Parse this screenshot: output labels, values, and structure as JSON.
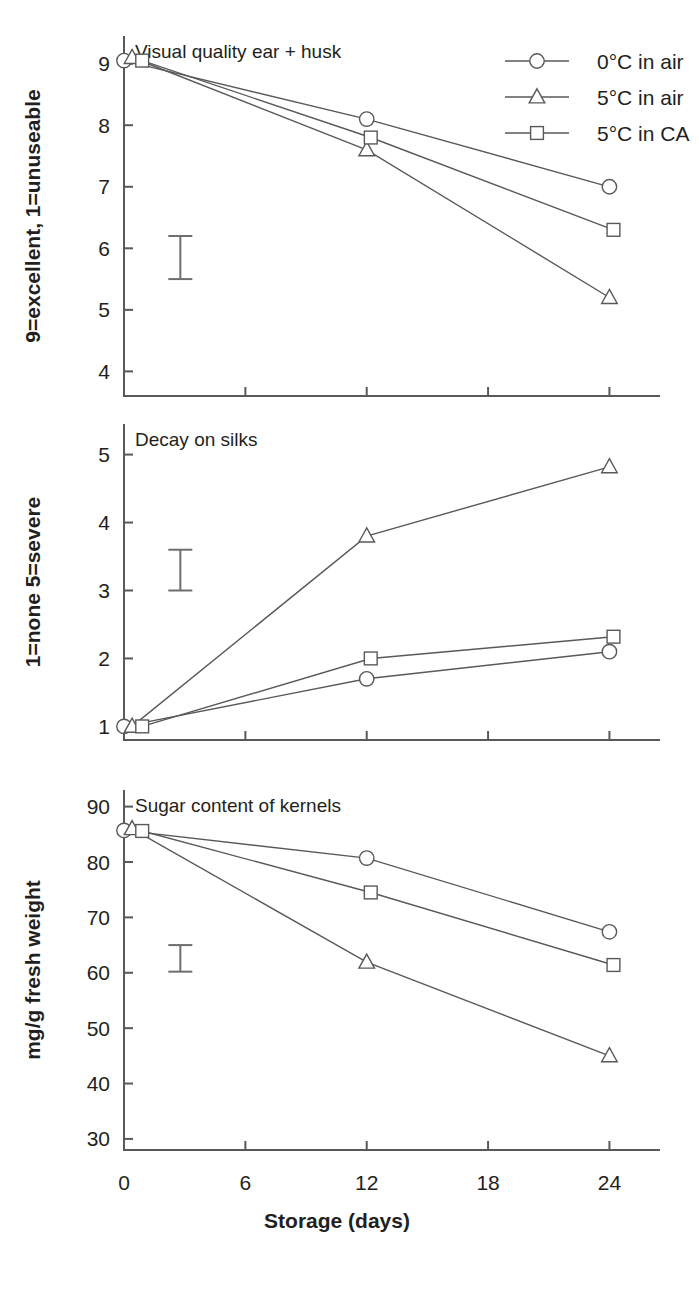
{
  "page": {
    "background": "#ffffff",
    "ink_color": "#231f20",
    "line_color": "#58595b",
    "cropped_header_text": ""
  },
  "legend": {
    "position": "top-right",
    "items": [
      {
        "label": "0°C in air",
        "marker": "circle",
        "marker_icon": "circle-marker-icon"
      },
      {
        "label": "5°C in air",
        "marker": "triangle",
        "marker_icon": "triangle-marker-icon"
      },
      {
        "label": "5°C in CA",
        "marker": "square",
        "marker_icon": "square-marker-icon"
      }
    ]
  },
  "shared": {
    "xlabel": "Storage (days)",
    "x_ticks": [
      0,
      6,
      12,
      18,
      24
    ],
    "x_tick_labels": [
      "0",
      "6",
      "12",
      "18",
      "24"
    ],
    "xlim": [
      0,
      26.5
    ]
  },
  "chart_data": [
    {
      "type": "line",
      "panel_index": 1,
      "title": "Visual quality ear + husk",
      "xlabel": "Storage (days)",
      "ylabel": "9=excellent,  1=unuseable",
      "x_ticks": [
        0,
        6,
        12,
        18,
        24
      ],
      "y_ticks": [
        4,
        5,
        6,
        7,
        8,
        9
      ],
      "y_tick_labels": [
        "4",
        "5",
        "6",
        "7",
        "8",
        "9"
      ],
      "xlim": [
        0,
        26.5
      ],
      "ylim": [
        3.6,
        9.45
      ],
      "grid": false,
      "legend": "top-right",
      "error_bar": {
        "x": 1.5,
        "low": 5.5,
        "high": 6.2,
        "label": "LSD"
      },
      "series": [
        {
          "name": "0°C in air",
          "marker": "circle",
          "x": [
            0,
            12,
            24
          ],
          "values": [
            9.05,
            8.1,
            7.0
          ]
        },
        {
          "name": "5°C in air",
          "marker": "triangle",
          "x": [
            0.4,
            12,
            24
          ],
          "values": [
            9.1,
            7.6,
            5.2
          ]
        },
        {
          "name": "5°C in CA",
          "marker": "square",
          "x": [
            0.9,
            12.2,
            24.2
          ],
          "values": [
            9.05,
            7.8,
            6.3
          ]
        }
      ]
    },
    {
      "type": "line",
      "panel_index": 2,
      "title": "Decay on silks",
      "xlabel": "Storage (days)",
      "ylabel": "1=none  5=severe",
      "x_ticks": [
        0,
        6,
        12,
        18,
        24
      ],
      "y_ticks": [
        1,
        2,
        3,
        4,
        5
      ],
      "y_tick_labels": [
        "1",
        "2",
        "3",
        "4",
        "5"
      ],
      "xlim": [
        0,
        26.5
      ],
      "ylim": [
        0.8,
        5.45
      ],
      "grid": false,
      "legend": "none",
      "error_bar": {
        "x": 1.5,
        "low": 3.0,
        "high": 3.6,
        "label": "LSD"
      },
      "series": [
        {
          "name": "0°C in air",
          "marker": "circle",
          "x": [
            0,
            12,
            24
          ],
          "values": [
            1.0,
            1.7,
            2.1
          ]
        },
        {
          "name": "5°C in air",
          "marker": "triangle",
          "x": [
            0.4,
            12,
            24
          ],
          "values": [
            1.0,
            3.8,
            4.82
          ]
        },
        {
          "name": "5°C in CA",
          "marker": "square",
          "x": [
            0.9,
            12.2,
            24.2
          ],
          "values": [
            1.0,
            2.0,
            2.32
          ]
        }
      ]
    },
    {
      "type": "line",
      "panel_index": 3,
      "title": "Sugar content of kernels",
      "xlabel": "Storage (days)",
      "ylabel": "mg/g fresh weight",
      "x_ticks": [
        0,
        6,
        12,
        18,
        24
      ],
      "y_ticks": [
        30,
        40,
        50,
        60,
        70,
        80,
        90
      ],
      "y_tick_labels": [
        "30",
        "40",
        "50",
        "60",
        "70",
        "80",
        "90"
      ],
      "xlim": [
        0,
        26.5
      ],
      "ylim": [
        28,
        93
      ],
      "grid": false,
      "legend": "none",
      "error_bar": {
        "x": 1.5,
        "low": 60.2,
        "high": 65.0,
        "label": "LSD"
      },
      "series": [
        {
          "name": "0°C in air",
          "marker": "circle",
          "x": [
            0,
            12,
            24
          ],
          "values": [
            85.7,
            80.7,
            67.4
          ]
        },
        {
          "name": "5°C in air",
          "marker": "triangle",
          "x": [
            0.4,
            12,
            24
          ],
          "values": [
            86.0,
            61.9,
            45.0
          ]
        },
        {
          "name": "5°C in CA",
          "marker": "square",
          "x": [
            0.9,
            12.2,
            24.2
          ],
          "values": [
            85.6,
            74.5,
            61.4
          ]
        }
      ]
    }
  ]
}
